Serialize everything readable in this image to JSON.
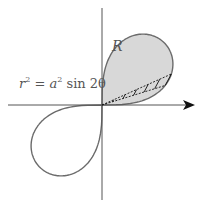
{
  "diagram": {
    "type": "polar-curve",
    "curve_name": "lemniscate",
    "equation": {
      "lhs_var": "r",
      "lhs_exp": "2",
      "eq": "=",
      "coef": "a",
      "coef_exp": "2",
      "func": "sin",
      "arg": "2θ"
    },
    "region_label": "R",
    "colors": {
      "curve": "#6b6b6b",
      "fill": "#d8d8d8",
      "axes": "#555555",
      "arrow": "#111111",
      "hatch": "#111111"
    },
    "origin": [
      102,
      105
    ],
    "a_px": 88
  }
}
